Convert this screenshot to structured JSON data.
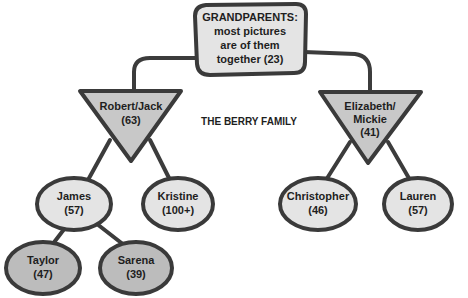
{
  "title": "THE BERRY FAMILY",
  "colors": {
    "outline": "#3a3a3a",
    "light_fill": "#e4e4e4",
    "mid_fill": "#c8c8c8",
    "dark_fill": "#bcbcbc",
    "text": "#1e1e1e"
  },
  "root": {
    "lines": [
      "GRANDPARENTS:",
      "most pictures",
      "are of them",
      "together (23)"
    ]
  },
  "parents": [
    {
      "lines": [
        "Robert/Jack",
        "(63)"
      ]
    },
    {
      "lines": [
        "Elizabeth/",
        "Mickie",
        "(41)"
      ]
    }
  ],
  "children": [
    {
      "name": "James",
      "count": "(57)"
    },
    {
      "name": "Kristine",
      "count": "(100+)"
    },
    {
      "name": "Christopher",
      "count": "(46)"
    },
    {
      "name": "Lauren",
      "count": "(57)"
    }
  ],
  "grandchildren": [
    {
      "name": "Taylor",
      "count": "(47)"
    },
    {
      "name": "Sarena",
      "count": "(39)"
    }
  ]
}
